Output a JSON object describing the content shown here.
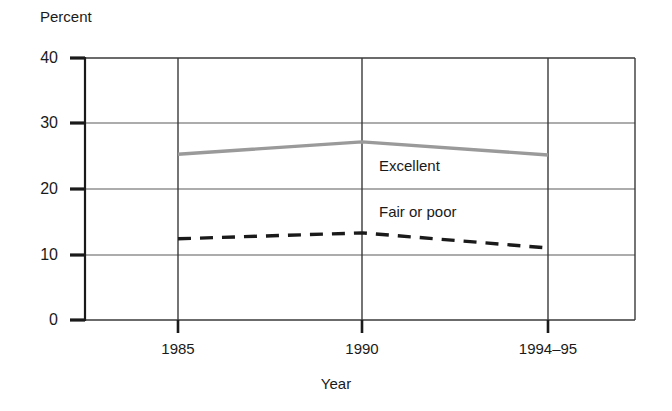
{
  "chart_data": {
    "type": "line",
    "title": "",
    "xlabel": "Year",
    "ylabel": "Percent",
    "categories": [
      "1985",
      "1990",
      "1994–95"
    ],
    "x_tick_labels": [
      "1985",
      "1990",
      "1994–95"
    ],
    "y_tick_labels": [
      "0",
      "10",
      "20",
      "30",
      "40"
    ],
    "y_ticks": [
      0,
      10,
      20,
      30,
      40
    ],
    "ylim": [
      0,
      40
    ],
    "grid": "both",
    "legend": "inline-labels",
    "series": [
      {
        "name": "Excellent",
        "label": "Excellent",
        "style": "solid",
        "color": "#9a9a9a",
        "values": [
          25.3,
          27.2,
          25.2
        ]
      },
      {
        "name": "Fair or poor",
        "label": "Fair or poor",
        "style": "dashed",
        "color": "#1a1a1a",
        "values": [
          12.4,
          13.3,
          11.0
        ]
      }
    ]
  },
  "axes": {
    "y_title": "Percent",
    "x_title": "Year"
  },
  "ticks": {
    "y": [
      {
        "label": "40",
        "value": 40
      },
      {
        "label": "30",
        "value": 30
      },
      {
        "label": "20",
        "value": 20
      },
      {
        "label": "10",
        "value": 10
      },
      {
        "label": "0",
        "value": 0
      }
    ],
    "x": [
      {
        "label": "1985"
      },
      {
        "label": "1990"
      },
      {
        "label": "1994–95"
      }
    ]
  },
  "series_labels": {
    "excellent": "Excellent",
    "fair_or_poor": "Fair or poor"
  },
  "colors": {
    "excellent_line": "#9a9a9a",
    "fair_or_poor_line": "#1a1a1a",
    "axis": "#1a1a1a",
    "grid": "#5a5a5a",
    "background": "#ffffff"
  }
}
